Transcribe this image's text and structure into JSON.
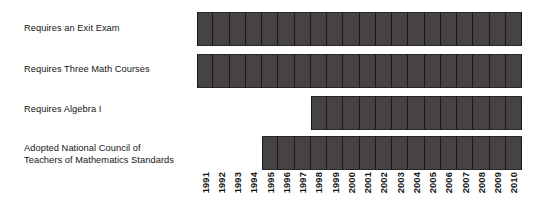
{
  "chart_data": {
    "type": "bar",
    "subtype": "timeline-span",
    "title": "",
    "subtitle": "",
    "xlabel": "",
    "ylabel": "",
    "grid": false,
    "legend": null,
    "axis": {
      "x_start": 1991,
      "x_end": 2010,
      "x_tick_count": 20
    },
    "categories": [
      "1991",
      "1992",
      "1993",
      "1994",
      "1995",
      "1996",
      "1997",
      "1998",
      "1999",
      "2000",
      "2001",
      "2002",
      "2003",
      "2004",
      "2005",
      "2006",
      "2007",
      "2008",
      "2009",
      "2010"
    ],
    "series": [
      {
        "name": "Requires an Exit Exam",
        "start_year": 1991,
        "end_year": 2010,
        "span_years": 20,
        "values": [
          1,
          1,
          1,
          1,
          1,
          1,
          1,
          1,
          1,
          1,
          1,
          1,
          1,
          1,
          1,
          1,
          1,
          1,
          1,
          1
        ]
      },
      {
        "name": "Requires Three Math Courses",
        "start_year": 1991,
        "end_year": 2010,
        "span_years": 20,
        "values": [
          1,
          1,
          1,
          1,
          1,
          1,
          1,
          1,
          1,
          1,
          1,
          1,
          1,
          1,
          1,
          1,
          1,
          1,
          1,
          1
        ]
      },
      {
        "name": "Requires Algebra I",
        "start_year": 1998,
        "end_year": 2010,
        "span_years": 13,
        "values": [
          0,
          0,
          0,
          0,
          0,
          0,
          0,
          1,
          1,
          1,
          1,
          1,
          1,
          1,
          1,
          1,
          1,
          1,
          1,
          1
        ]
      },
      {
        "name": "Adopted National Council of\nTeachers of Mathematics Standards",
        "start_year": 1995,
        "end_year": 2010,
        "span_years": 16,
        "values": [
          0,
          0,
          0,
          0,
          1,
          1,
          1,
          1,
          1,
          1,
          1,
          1,
          1,
          1,
          1,
          1,
          1,
          1,
          1,
          1
        ]
      }
    ],
    "colors": {
      "bar_fill": "#474343",
      "bar_divider": "#1b1818",
      "background": "#ffffff",
      "text": "#151515"
    }
  },
  "rows": [
    {
      "label": "Requires an Exit Exam"
    },
    {
      "label": "Requires Three Math Courses"
    },
    {
      "label": "Requires Algebra I"
    },
    {
      "label": "Adopted National Council of\nTeachers of Mathematics Standards"
    }
  ]
}
